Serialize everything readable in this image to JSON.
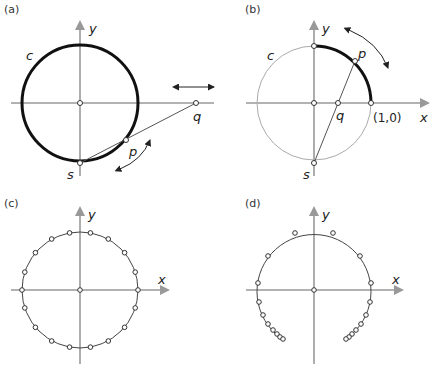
{
  "panels": {
    "a": {
      "label": "(a)",
      "axis_x": "x",
      "axis_y": "y",
      "circle_label": "c",
      "point_p": "p",
      "point_q": "q",
      "point_s": "s"
    },
    "b": {
      "label": "(b)",
      "axis_x": "x",
      "axis_y": "y",
      "circle_label": "c",
      "point_p": "p",
      "point_q": "q",
      "point_s": "s",
      "point_one": "(1,0)"
    },
    "c": {
      "label": "(c)",
      "axis_x": "x",
      "axis_y": "y"
    },
    "d": {
      "label": "(d)",
      "axis_x": "x",
      "axis_y": "y"
    }
  },
  "colors": {
    "axis": "#999999",
    "thick_circle": "#111111",
    "thin_circle": "#aaaaaa",
    "line": "#555555"
  }
}
